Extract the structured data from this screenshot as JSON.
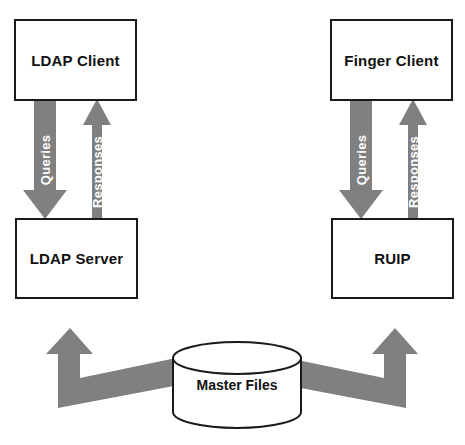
{
  "diagram": {
    "colors": {
      "arrow_fill": "#808080",
      "box_border": "#1a1a1a",
      "box_fill": "#ffffff",
      "label_text": "#111111",
      "arrow_text": "#ffffff",
      "page_background": "#ffffff"
    },
    "nodes": [
      {
        "id": "ldap-client",
        "label": "LDAP Client",
        "shape": "rectangle"
      },
      {
        "id": "ldap-server",
        "label": "LDAP Server",
        "shape": "rectangle"
      },
      {
        "id": "finger-client",
        "label": "Finger Client",
        "shape": "rectangle"
      },
      {
        "id": "ruip",
        "label": "RUIP",
        "shape": "rectangle"
      },
      {
        "id": "master-files",
        "label": "Master Files",
        "shape": "cylinder"
      }
    ],
    "edges": [
      {
        "id": "ldap-queries",
        "label": "Queries",
        "from": "ldap-client",
        "to": "ldap-server",
        "direction": "down"
      },
      {
        "id": "ldap-responses",
        "label": "Responses",
        "from": "ldap-server",
        "to": "ldap-client",
        "direction": "up"
      },
      {
        "id": "finger-queries",
        "label": "Queries",
        "from": "finger-client",
        "to": "ruip",
        "direction": "down"
      },
      {
        "id": "finger-responses",
        "label": "Responses",
        "from": "ruip",
        "to": "finger-client",
        "direction": "up"
      },
      {
        "id": "master-to-ldap-server",
        "label": "",
        "from": "master-files",
        "to": "ldap-server",
        "direction": "up-left-elbow"
      },
      {
        "id": "master-to-ruip",
        "label": "",
        "from": "master-files",
        "to": "ruip",
        "direction": "up-right-elbow"
      }
    ]
  }
}
